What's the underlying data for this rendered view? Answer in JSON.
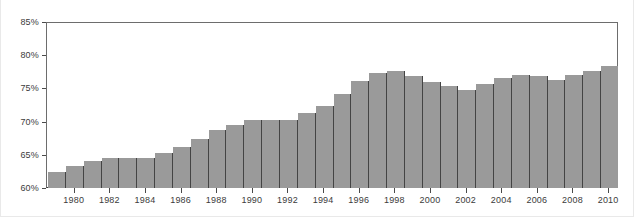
{
  "chart_data": {
    "type": "bar",
    "title": "",
    "subtitle": "",
    "xlabel": "",
    "ylabel": "",
    "ylim": [
      60,
      85
    ],
    "ytick_labels": [
      "60%",
      "65%",
      "70%",
      "75%",
      "80%",
      "85%"
    ],
    "ytick_values": [
      60,
      65,
      70,
      75,
      80,
      85
    ],
    "xtick_labels": [
      "1980",
      "1982",
      "1984",
      "1986",
      "1988",
      "1990",
      "1992",
      "1994",
      "1996",
      "1998",
      "2000",
      "2002",
      "2004",
      "2006",
      "2008",
      "2010"
    ],
    "xtick_values": [
      1980,
      1982,
      1984,
      1986,
      1988,
      1990,
      1992,
      1994,
      1996,
      1998,
      2000,
      2002,
      2004,
      2006,
      2008,
      2010
    ],
    "grid": false,
    "legend": [],
    "legend_position": "none",
    "bar_fill_color": "#9a9a9a",
    "bar_edge_color": "#444444",
    "axis_color": "#4a4a4a",
    "plot_background": "#ffffff",
    "categories": [
      1979,
      1980,
      1981,
      1982,
      1983,
      1984,
      1985,
      1986,
      1987,
      1988,
      1989,
      1990,
      1991,
      1992,
      1993,
      1994,
      1995,
      1996,
      1997,
      1998,
      1999,
      2000,
      2001,
      2002,
      2003,
      2004,
      2005,
      2006,
      2007,
      2008,
      2009,
      2010
    ],
    "values": [
      62.4,
      63.3,
      64.1,
      64.5,
      64.5,
      64.6,
      65.4,
      66.3,
      67.5,
      68.8,
      69.6,
      70.3,
      70.4,
      70.4,
      71.5,
      72.5,
      74.4,
      76.3,
      77.5,
      77.9,
      77.0,
      76.2,
      75.6,
      75.0,
      75.8,
      76.7,
      77.2,
      77.0,
      76.5,
      77.2,
      77.9,
      78.6
    ],
    "series": [
      {
        "name": "value",
        "values": [
          62.4,
          63.3,
          64.1,
          64.5,
          64.5,
          64.6,
          65.4,
          66.3,
          67.5,
          68.8,
          69.6,
          70.3,
          70.4,
          70.4,
          71.5,
          72.5,
          74.4,
          76.3,
          77.5,
          77.9,
          77.0,
          76.2,
          75.6,
          75.0,
          75.8,
          76.7,
          77.2,
          77.0,
          76.5,
          77.2,
          77.9,
          78.6
        ]
      }
    ]
  }
}
